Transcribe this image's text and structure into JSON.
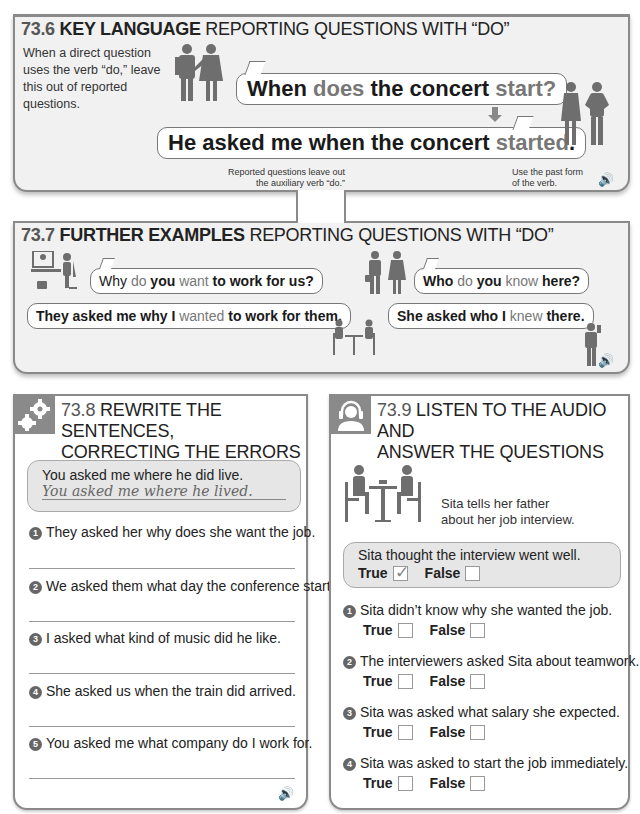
{
  "section_73_6": {
    "number": "73.6",
    "title_bold": "KEY LANGUAGE",
    "title_rest": "REPORTING QUESTIONS WITH “DO”",
    "intro": "When a direct question uses the verb “do,” leave this out of reported questions.",
    "direct_question": {
      "p1": "When ",
      "p2": "does",
      "p3": " the concert ",
      "p4": "start",
      "p5": "?"
    },
    "reported_question": {
      "p1": "He asked me when the concert ",
      "p2": "started",
      "p3": "."
    },
    "note_left": "Reported questions leave out the auxiliary verb “do.”",
    "note_right": "Use the past form of the verb.",
    "audio_icon": "speaker-icon"
  },
  "section_73_7": {
    "number": "73.7",
    "title_bold": "FURTHER EXAMPLES",
    "title_rest": "REPORTING QUESTIONS WITH “DO”",
    "examples": [
      {
        "direct": {
          "p1": "Why ",
          "p2": "do",
          "p3": " you ",
          "p4": "want",
          "p5": " to work for us?"
        },
        "reported": {
          "p1": "They asked me why I ",
          "p2": "wanted",
          "p3": " to work for them."
        }
      },
      {
        "direct": {
          "p1": "Who ",
          "p2": "do",
          "p3": " you ",
          "p4": "know",
          "p5": " here?"
        },
        "reported": {
          "p1": "She asked who I ",
          "p2": "knew",
          "p3": " there."
        }
      }
    ],
    "audio_icon": "speaker-icon"
  },
  "section_73_8": {
    "number": "73.8",
    "title_line1": "REWRITE THE SENTENCES,",
    "title_line2": "CORRECTING THE ERRORS",
    "example_question": "You asked me where he did live.",
    "example_answer": "You asked me where he lived.",
    "items": [
      {
        "n": "1",
        "text": "They asked her why does she want the job."
      },
      {
        "n": "2",
        "text": "We asked them what day the conference start."
      },
      {
        "n": "3",
        "text": "I asked what kind of music did he like."
      },
      {
        "n": "4",
        "text": "She asked us when the train did arrived."
      },
      {
        "n": "5",
        "text": "You asked me what company do I work for."
      }
    ],
    "audio_icon": "speaker-icon"
  },
  "section_73_9": {
    "number": "73.9",
    "title_line1": "LISTEN TO THE AUDIO AND",
    "title_line2": "ANSWER THE QUESTIONS",
    "caption_line1": "Sita tells her father",
    "caption_line2": "about her job interview.",
    "true_label": "True",
    "false_label": "False",
    "example": {
      "text": "Sita thought the interview went well.",
      "answer": "True"
    },
    "items": [
      {
        "n": "1",
        "text": "Sita didn’t know why she wanted the job."
      },
      {
        "n": "2",
        "text": "The interviewers asked Sita about teamwork."
      },
      {
        "n": "3",
        "text": "Sita was asked what salary she expected."
      },
      {
        "n": "4",
        "text": "Sita was asked to start the job immediately."
      }
    ]
  },
  "colors": {
    "panel_bg": "#f1f1f1",
    "border": "#8a8a8a",
    "highlight_gray": "#777777",
    "text": "#222222"
  }
}
